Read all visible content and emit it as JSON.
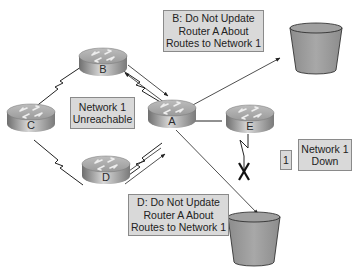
{
  "routers": [
    {
      "id": "A",
      "label": "A"
    },
    {
      "id": "B",
      "label": "B"
    },
    {
      "id": "C",
      "label": "C"
    },
    {
      "id": "D",
      "label": "D"
    },
    {
      "id": "E",
      "label": "E"
    }
  ],
  "labels": {
    "network_unreachable": {
      "line1": "Network 1",
      "line2": "Unreachable"
    },
    "b_message": {
      "line1": "B: Do Not Update",
      "line2": "Router A About",
      "line3": "Routes to Network 1"
    },
    "d_message": {
      "line1": "D: Do Not Update",
      "line2": "Router A About",
      "line3": "Routes to Network 1"
    },
    "network_down": {
      "line1": "Network 1",
      "line2": "Down"
    },
    "network_number": "1"
  },
  "colors": {
    "label_fill": "#d9d9d9",
    "bucket_fill": "#9a9a9a",
    "router_fill": "#a9a9a9"
  }
}
